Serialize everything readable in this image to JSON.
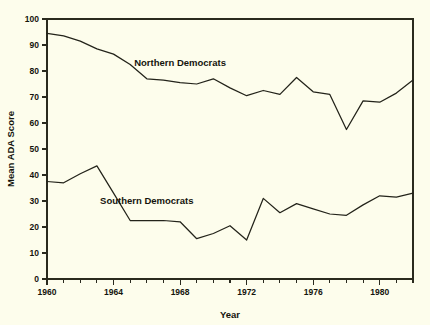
{
  "chart_data": {
    "type": "line",
    "title": "",
    "xlabel": "Year",
    "ylabel": "Mean ADA Score",
    "xlim": [
      1960,
      1982
    ],
    "ylim": [
      0,
      100
    ],
    "grid": false,
    "legend_position": "inline-annotations",
    "x_tick_labels": [
      "1960",
      "1964",
      "1968",
      "1972",
      "1976",
      "1980"
    ],
    "x_tick_label_values": [
      1960,
      1964,
      1968,
      1972,
      1976,
      1980
    ],
    "x_minor_tick_step": 1,
    "y_tick_labels": [
      "0",
      "10",
      "20",
      "30",
      "40",
      "50",
      "60",
      "70",
      "80",
      "90",
      "100"
    ],
    "y_tick_label_values": [
      0,
      10,
      20,
      30,
      40,
      50,
      60,
      70,
      80,
      90,
      100
    ],
    "x": [
      1960,
      1961,
      1962,
      1963,
      1964,
      1965,
      1966,
      1967,
      1968,
      1969,
      1970,
      1971,
      1972,
      1973,
      1974,
      1975,
      1976,
      1977,
      1978,
      1979,
      1980,
      1981,
      1982
    ],
    "series": [
      {
        "name": "Northern Democrats",
        "label_x": 1968,
        "label_y": 82,
        "values": [
          94.5,
          93.5,
          91.5,
          88.5,
          86.5,
          82.5,
          77.0,
          76.5,
          75.5,
          75.0,
          77.0,
          73.5,
          70.5,
          72.5,
          71.0,
          77.5,
          72.0,
          71.0,
          57.5,
          68.5,
          68.0,
          71.5,
          76.5
        ]
      },
      {
        "name": "Southern Democrats",
        "label_x": 1966,
        "label_y": 29,
        "values": [
          37.5,
          37.0,
          40.5,
          43.5,
          33.0,
          22.5,
          22.5,
          22.5,
          22.0,
          15.5,
          17.5,
          20.5,
          15.0,
          31.0,
          25.5,
          29.0,
          27.0,
          25.0,
          24.5,
          28.5,
          32.0,
          31.5,
          33.0
        ]
      }
    ]
  },
  "axes": {
    "x_title": "Year",
    "y_title": "Mean ADA Score"
  }
}
